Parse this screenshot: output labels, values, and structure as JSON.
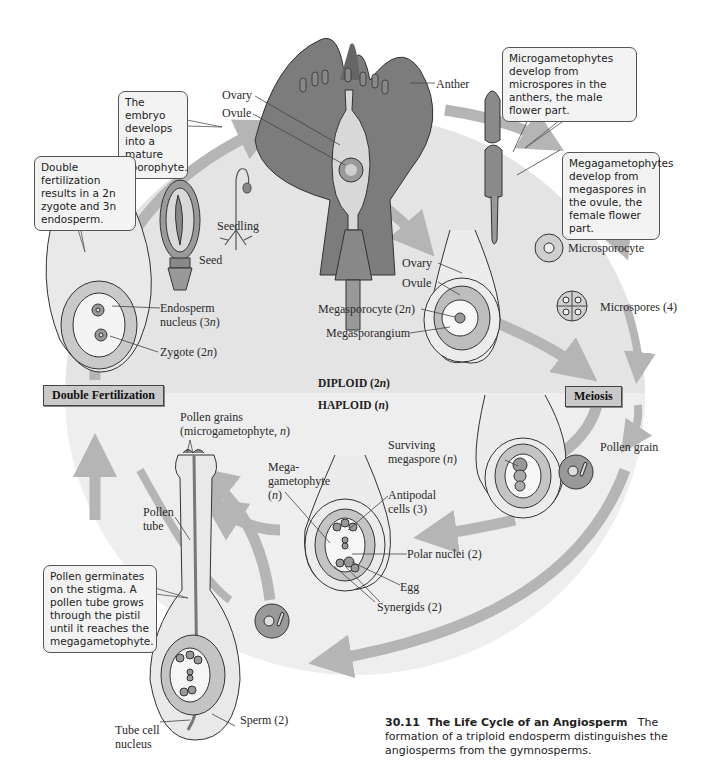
{
  "figure": {
    "number": "30.11",
    "title": "The Life Cycle of an Angiosperm",
    "caption": "The formation of a triploid endosperm distinguishes the angiosperms from the gymnosperms."
  },
  "ploidy": {
    "diploid": "DIPLOID (2n)",
    "haploid": "HAPLOID (n)"
  },
  "stages": {
    "double_fertilization": "Double Fertilization",
    "meiosis": "Meiosis"
  },
  "callouts": {
    "embryo": "The embryo develops into a mature sporophyte.",
    "double_fert": "Double fertilization results in a 2n zygote and 3n endosperm.",
    "micro": "Microgametophytes develop from microspores in the anthers, the male flower part.",
    "mega": "Megagametophytes develop from megaspores in the ovule, the female flower part.",
    "pollen": "Pollen germinates on the stigma. A pollen tube grows through the pistil until it reaches the megagametophyte."
  },
  "labels": {
    "flower_ovary": "Ovary",
    "flower_ovule": "Ovule",
    "anther": "Anther",
    "seedling": "Seedling",
    "seed": "Seed",
    "endosperm_nucleus": "Endosperm nucleus (3n)",
    "endosperm_line1": "Endosperm",
    "endosperm_line2": "nucleus (3n)",
    "zygote": "Zygote (2n)",
    "ovary": "Ovary",
    "ovule": "Ovule",
    "megasporocyte": "Megasporocyte (2n)",
    "megasporangium": "Megasporangium",
    "microsporocyte": "Microsporocyte",
    "microspores": "Microspores (4)",
    "pollen_grain": "Pollen grain",
    "surviving_line1": "Surviving",
    "surviving_line2": "megaspore (n)",
    "mega_line1": "Mega-",
    "mega_line2": "gametophyte",
    "mega_line3": "(n)",
    "antipodal_line1": "Antipodal",
    "antipodal_line2": "cells (3)",
    "polar_nuclei": "Polar nuclei (2)",
    "egg": "Egg",
    "synergids": "Synergids (2)",
    "pollen_grains_line1": "Pollen grains",
    "pollen_grains_line2": "(microgametophyte, n)",
    "pollen_tube_line1": "Pollen",
    "pollen_tube_line2": "tube",
    "sperm": "Sperm (2)",
    "tube_cell_line1": "Tube cell",
    "tube_cell_line2": "nucleus"
  },
  "colors": {
    "arrow": "#b5b5b5",
    "diploid_bg": "#e6e6e6",
    "haploid_bg": "#efefef",
    "tissue_dark": "#9a9a9a",
    "tissue_mid": "#c4c4c4",
    "tissue_light": "#e2e2e2"
  }
}
